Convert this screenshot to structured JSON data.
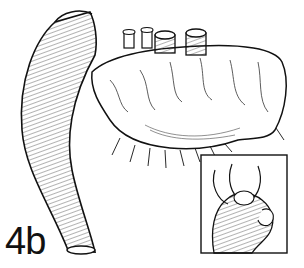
{
  "figure": {
    "label": "4b",
    "inset": "detail of suture knot"
  },
  "colors": {
    "ink": "#111111",
    "background": "#ffffff"
  }
}
